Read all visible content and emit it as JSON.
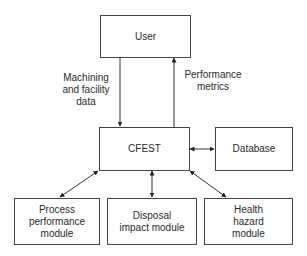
{
  "diagram": {
    "nodes": {
      "user": "User",
      "cfest": "CFEST",
      "database": "Database",
      "process": [
        "Process",
        "performance",
        "module"
      ],
      "disposal": [
        "Disposal",
        "impact module"
      ],
      "health": [
        "Health",
        "hazard",
        "module"
      ]
    },
    "edge_labels": {
      "input": [
        "Machining",
        "and facility",
        "data"
      ],
      "output": [
        "Performance",
        "metrics"
      ]
    },
    "edges": [
      {
        "from": "User",
        "to": "CFEST",
        "label": "Machining and facility data",
        "direction": "one-way"
      },
      {
        "from": "CFEST",
        "to": "User",
        "label": "Performance metrics",
        "direction": "one-way"
      },
      {
        "from": "CFEST",
        "to": "Database",
        "direction": "bidirectional"
      },
      {
        "from": "CFEST",
        "to": "Process performance module",
        "direction": "bidirectional"
      },
      {
        "from": "CFEST",
        "to": "Disposal impact module",
        "direction": "bidirectional"
      },
      {
        "from": "CFEST",
        "to": "Health hazard module",
        "direction": "bidirectional"
      }
    ]
  }
}
